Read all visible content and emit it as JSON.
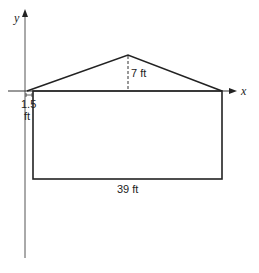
{
  "diagram": {
    "axes": {
      "x_label": "x",
      "y_label": "y"
    },
    "labels": {
      "height": "7 ft",
      "offset_value": "1.5",
      "offset_unit": "ft",
      "width": "39 ft"
    },
    "colors": {
      "line": "#222222",
      "axis": "#444444"
    }
  }
}
